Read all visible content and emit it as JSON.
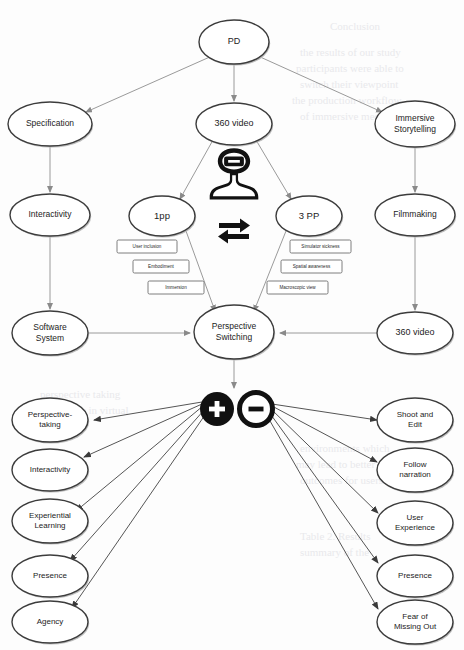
{
  "diagram": {
    "type": "concept-map",
    "root": {
      "id": "pd",
      "label": "PD",
      "cx": 234,
      "cy": 42,
      "rx": 35,
      "ry": 22
    },
    "top_nodes": [
      {
        "id": "specification",
        "label": "Specification",
        "cx": 50,
        "cy": 124,
        "rx": 42,
        "ry": 22,
        "font": 8.5
      },
      {
        "id": "video360-top",
        "label": "360 video",
        "cx": 234,
        "cy": 124,
        "rx": 38,
        "ry": 21,
        "font": 9
      },
      {
        "id": "immersive-storytelling",
        "label_lines": [
          "Immersive",
          "Storytelling"
        ],
        "cx": 415,
        "cy": 124,
        "rx": 40,
        "ry": 23,
        "font": 8.5
      }
    ],
    "left_column": [
      {
        "id": "interactivity-left",
        "label": "Interactivity",
        "cx": 50,
        "cy": 215,
        "rx": 40,
        "ry": 21,
        "font": 8.5
      },
      {
        "id": "software-system",
        "label_lines": [
          "Software",
          "System"
        ],
        "cx": 50,
        "cy": 333,
        "rx": 38,
        "ry": 22,
        "font": 8.5
      }
    ],
    "right_column": [
      {
        "id": "filmmaking",
        "label": "Filmmaking",
        "cx": 415,
        "cy": 215,
        "rx": 40,
        "ry": 21,
        "font": 8.5
      },
      {
        "id": "video360-bottom",
        "label": "360 video",
        "cx": 415,
        "cy": 333,
        "rx": 38,
        "ry": 21,
        "font": 9
      }
    ],
    "perspective_nodes": [
      {
        "id": "first-person",
        "label": "1pp",
        "cx": 162,
        "cy": 216,
        "rx": 33,
        "ry": 20,
        "font": 9.5
      },
      {
        "id": "third-person",
        "label": "3 PP",
        "cx": 309,
        "cy": 216,
        "rx": 33,
        "ry": 20,
        "font": 9.5
      }
    ],
    "center_node": {
      "id": "perspective-switching",
      "label_lines": [
        "Perspective",
        "Switching"
      ],
      "cx": 234,
      "cy": 332,
      "rx": 40,
      "ry": 27,
      "font": 8.5
    },
    "left_attributes": [
      {
        "id": "user-inclusion",
        "label": "User  inclusion",
        "x": 117,
        "y": 240,
        "w": 60,
        "h": 13
      },
      {
        "id": "embodiment",
        "label": "Embodiment",
        "x": 133,
        "y": 260,
        "w": 56,
        "h": 13
      },
      {
        "id": "immersion",
        "label": "Immersion",
        "x": 148,
        "y": 281,
        "w": 56,
        "h": 13
      }
    ],
    "right_attributes": [
      {
        "id": "simulator-sickness",
        "label": "Simulator sickness",
        "x": 290,
        "y": 240,
        "w": 61,
        "h": 13
      },
      {
        "id": "spatial-awareness",
        "label": "Spatial awareness",
        "x": 281,
        "y": 260,
        "w": 61,
        "h": 13
      },
      {
        "id": "macroscopic-view",
        "label": "Macroscopic view",
        "x": 267,
        "y": 281,
        "w": 61,
        "h": 13
      }
    ],
    "icons": {
      "vr_user": {
        "name": "vr-headset-user-icon",
        "cx": 234,
        "cy": 178
      },
      "swap": {
        "name": "bidirectional-swap-icon",
        "cx": 234,
        "cy": 229
      },
      "plus": {
        "name": "plus-circle-icon",
        "cx": 217,
        "cy": 409,
        "r": 17,
        "symbol": "+",
        "style": "filled"
      },
      "minus": {
        "name": "minus-circle-icon",
        "cx": 256,
        "cy": 409,
        "r": 17,
        "symbol": "−",
        "style": "outline"
      }
    },
    "positive_outcomes": [
      {
        "id": "perspective-taking",
        "label_lines": [
          "Perspective-",
          "taking"
        ],
        "cx": 50,
        "cy": 420,
        "rx": 38,
        "ry": 22,
        "font": 8
      },
      {
        "id": "interactivity-outcome",
        "label": "Interactivity",
        "cx": 50,
        "cy": 470,
        "rx": 38,
        "ry": 21,
        "font": 8
      },
      {
        "id": "experiential-learning",
        "label_lines": [
          "Experiential",
          "Learning"
        ],
        "cx": 50,
        "cy": 521,
        "rx": 38,
        "ry": 22,
        "font": 8
      },
      {
        "id": "presence-left",
        "label": "Presence",
        "cx": 50,
        "cy": 576,
        "rx": 38,
        "ry": 21,
        "font": 8
      },
      {
        "id": "agency",
        "label": "Agency",
        "cx": 50,
        "cy": 622,
        "rx": 38,
        "ry": 21,
        "font": 8
      }
    ],
    "negative_outcomes": [
      {
        "id": "shoot-and-edit",
        "label_lines": [
          "Shoot and",
          "Edit"
        ],
        "cx": 415,
        "cy": 420,
        "rx": 38,
        "ry": 22,
        "font": 8
      },
      {
        "id": "follow-narration",
        "label_lines": [
          "Follow",
          "narration"
        ],
        "cx": 415,
        "cy": 470,
        "rx": 38,
        "ry": 22,
        "font": 8
      },
      {
        "id": "user-experience",
        "label_lines": [
          "User",
          "Experience"
        ],
        "cx": 415,
        "cy": 523,
        "rx": 38,
        "ry": 22,
        "font": 8
      },
      {
        "id": "presence-right",
        "label": "Presence",
        "cx": 415,
        "cy": 576,
        "rx": 38,
        "ry": 21,
        "font": 8
      },
      {
        "id": "fear-of-missing-out",
        "label_lines": [
          "Fear of",
          "Missing Out"
        ],
        "cx": 415,
        "cy": 622,
        "rx": 38,
        "ry": 22,
        "font": 8
      }
    ],
    "colors": {
      "node_stroke": "#3c3c3c",
      "node_fill": "#ffffff",
      "edge": "#9a9a9a",
      "edge_dark": "#555555",
      "icon": "#111111",
      "background": "#fdfdfd",
      "bleed_text": "#e9e9ec"
    },
    "background_bleed_lines": [
      {
        "text": "Conclusion",
        "x": 330,
        "y": 30,
        "size": 13
      },
      {
        "text": "the results of our study",
        "x": 300,
        "y": 56,
        "size": 11
      },
      {
        "text": "participants were able to",
        "x": 296,
        "y": 72,
        "size": 11
      },
      {
        "text": "switch their viewpoint",
        "x": 300,
        "y": 88,
        "size": 11
      },
      {
        "text": "the production workflow",
        "x": 292,
        "y": 104,
        "size": 11
      },
      {
        "text": "of immersive media",
        "x": 300,
        "y": 120,
        "size": 11
      },
      {
        "text": "perspective taking",
        "x": 40,
        "y": 398,
        "size": 11
      },
      {
        "text": "and agency in virtual",
        "x": 36,
        "y": 414,
        "size": 11
      },
      {
        "text": "environments which",
        "x": 300,
        "y": 452,
        "size": 11
      },
      {
        "text": "may lead to better",
        "x": 296,
        "y": 468,
        "size": 11
      },
      {
        "text": "outcomes for users",
        "x": 300,
        "y": 484,
        "size": 11
      },
      {
        "text": "Table 2. Results",
        "x": 300,
        "y": 540,
        "size": 12
      },
      {
        "text": "summary of the",
        "x": 300,
        "y": 556,
        "size": 11
      }
    ]
  }
}
